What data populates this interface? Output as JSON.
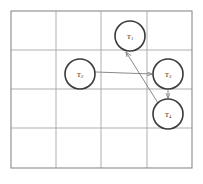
{
  "figure": {
    "kind": "grid-diagram",
    "background_color": "#ffffff",
    "width": 203,
    "height": 184
  },
  "frame": {
    "name": "outer-frame",
    "x": 11,
    "y": 11,
    "width": 181,
    "height": 157,
    "stroke_color": "#8a8a8a",
    "stroke_width": 1.1
  },
  "grid": {
    "columns": 4,
    "rows": 4,
    "line_color": "#a6a6a6",
    "line_width": 0.9,
    "vertical_lines_x": [
      56,
      101,
      147
    ],
    "horizontal_lines_y": [
      50,
      89,
      128
    ]
  },
  "nodes": [
    {
      "id": "T1",
      "name": "node-t1",
      "label_base": "T",
      "label_sub": "1",
      "cx": 130,
      "cy": 36,
      "r": 15,
      "stroke_color": "#3a3a3a",
      "stroke_width": 1.6,
      "fill_color": "#ffffff"
    },
    {
      "id": "T2",
      "name": "node-t2",
      "label_base": "T",
      "label_sub": "2",
      "cx": 80,
      "cy": 74,
      "r": 15,
      "stroke_color": "#3a3a3a",
      "stroke_width": 1.6,
      "fill_color": "#ffffff"
    },
    {
      "id": "T3",
      "name": "node-t3",
      "label_base": "T",
      "label_sub": "3",
      "cx": 168,
      "cy": 74,
      "r": 15,
      "stroke_color": "#3a3a3a",
      "stroke_width": 1.6,
      "fill_color": "#ffffff"
    },
    {
      "id": "T4",
      "name": "node-t4",
      "label_base": "T",
      "label_sub": "4",
      "cx": 168,
      "cy": 114,
      "r": 15,
      "stroke_color": "#3a3a3a",
      "stroke_width": 1.6,
      "fill_color": "#ffffff"
    }
  ],
  "edges": [
    {
      "id": "e1",
      "name": "arrow-t2-to-t3",
      "from": "T2",
      "to": "T3",
      "x1": 96,
      "y1": 72,
      "x2": 152,
      "y2": 74,
      "stroke_color": "#7d7d7d",
      "stroke_width": 0.9,
      "arrowhead": "end"
    },
    {
      "id": "e2",
      "name": "arrow-t4-to-t1",
      "from": "T4",
      "to": "T1",
      "x1": 158,
      "y1": 103,
      "x2": 126,
      "y2": 52,
      "stroke_color": "#7d7d7d",
      "stroke_width": 0.9,
      "arrowhead": "end"
    },
    {
      "id": "e3",
      "name": "arrow-t3-to-t4",
      "from": "T3",
      "to": "T4",
      "x1": 168,
      "y1": 90,
      "x2": 168,
      "y2": 98,
      "stroke_color": "#7d7d7d",
      "stroke_width": 0.9,
      "arrowhead": "end"
    }
  ]
}
